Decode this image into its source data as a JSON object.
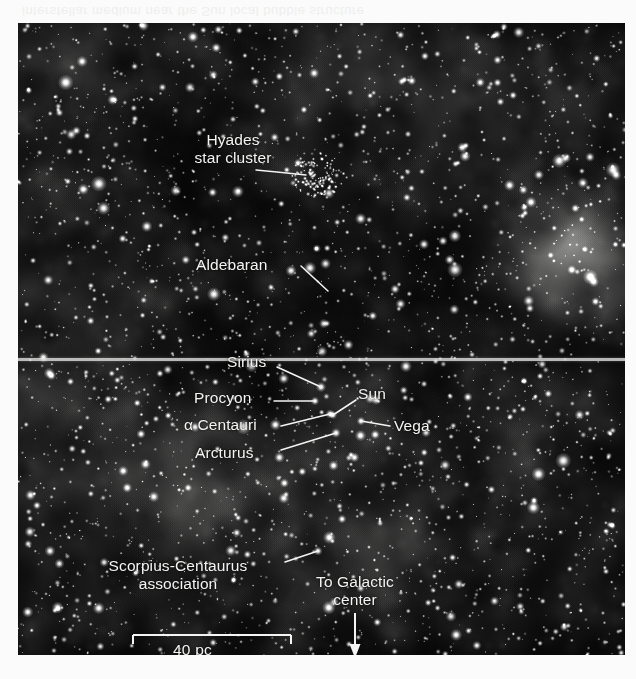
{
  "figure": {
    "name": "solar-neighborhood-sky-map",
    "ghost_caption": "interstellar medium near the Sun  local bubble structure",
    "plate": {
      "x": 18,
      "y": 23,
      "width": 607,
      "height": 632
    },
    "scan_seam_y": 335,
    "colors": {
      "sky_dark": "#070708",
      "nebula_grey": "#9a9a96",
      "star_white": "#ffffff",
      "label_white": "#f4f4f2",
      "page": "#ffffff"
    }
  },
  "labels": [
    {
      "id": "hyades",
      "text": "Hyades\nstar cluster",
      "lines": [
        "Hyades",
        "star cluster"
      ],
      "x": 150,
      "y": 108,
      "align": "center",
      "width": 130,
      "leader": {
        "x1": 238,
        "y1": 147,
        "x2": 288,
        "y2": 152
      }
    },
    {
      "id": "aldebaran",
      "text": "Aldebaran",
      "lines": [
        "Aldebaran"
      ],
      "x": 178,
      "y": 233,
      "align": "left",
      "width": 90,
      "leader": {
        "x1": 283,
        "y1": 243,
        "x2": 310,
        "y2": 268
      }
    },
    {
      "id": "sirius",
      "text": "Sirius",
      "lines": [
        "Sirius"
      ],
      "x": 209,
      "y": 330,
      "align": "left",
      "width": 54,
      "leader": {
        "x1": 259,
        "y1": 344,
        "x2": 303,
        "y2": 364
      }
    },
    {
      "id": "procyon",
      "text": "Procyon",
      "lines": [
        "Procyon"
      ],
      "x": 176,
      "y": 366,
      "align": "left",
      "width": 75,
      "leader": {
        "x1": 256,
        "y1": 378,
        "x2": 297,
        "y2": 378
      }
    },
    {
      "id": "alpha-centauri",
      "text": "α Centauri",
      "lines": [
        "α Centauri"
      ],
      "x": 166,
      "y": 393,
      "align": "left",
      "width": 92,
      "leader": {
        "x1": 263,
        "y1": 403,
        "x2": 312,
        "y2": 391
      }
    },
    {
      "id": "arcturus",
      "text": "Arcturus",
      "lines": [
        "Arcturus"
      ],
      "x": 177,
      "y": 421,
      "align": "left",
      "width": 80,
      "leader": {
        "x1": 263,
        "y1": 427,
        "x2": 318,
        "y2": 410
      }
    },
    {
      "id": "sun",
      "text": "Sun",
      "lines": [
        "Sun"
      ],
      "x": 340,
      "y": 362,
      "align": "left",
      "width": 40,
      "leader": {
        "x1": 338,
        "y1": 377,
        "x2": 315,
        "y2": 392
      }
    },
    {
      "id": "vega",
      "text": "Vega",
      "lines": [
        "Vega"
      ],
      "x": 376,
      "y": 394,
      "align": "left",
      "width": 46,
      "leader": {
        "x1": 372,
        "y1": 403,
        "x2": 343,
        "y2": 398
      }
    },
    {
      "id": "scorpius-centaurus",
      "text": "Scorpius-Centaurus\nassociation",
      "lines": [
        "Scorpius-Centaurus",
        "association"
      ],
      "x": 60,
      "y": 534,
      "align": "center",
      "width": 200,
      "leader": {
        "x1": 267,
        "y1": 539,
        "x2": 300,
        "y2": 528
      }
    },
    {
      "id": "galactic-center",
      "text": "To Galactic\ncenter",
      "lines": [
        "To Galactic",
        "center"
      ],
      "x": 278,
      "y": 550,
      "align": "center",
      "width": 118,
      "leader": null
    }
  ],
  "galactic_arrow": {
    "name": "to-galactic-center-arrow",
    "x": 337,
    "y_start": 590,
    "y_end": 635,
    "head_width": 11,
    "head_length": 14
  },
  "scale_bar": {
    "label": "40 pc",
    "x1": 115,
    "x2": 273,
    "y": 612,
    "tick_height": 9,
    "caption_x": 155,
    "caption_y": 618
  }
}
